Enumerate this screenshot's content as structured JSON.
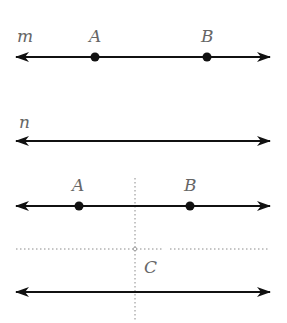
{
  "figure": {
    "width": 287,
    "height": 323,
    "colors": {
      "line": "#111111",
      "label": "#666666",
      "dotted": "#8a8a8a",
      "background": "#ffffff"
    },
    "panel1": {
      "line_label": "m",
      "line_y": 57,
      "points": [
        {
          "label": "A",
          "x": 95
        },
        {
          "label": "B",
          "x": 207
        }
      ]
    },
    "panel2": {
      "line_label": "n",
      "line_y": 141
    },
    "panel3": {
      "top_line_y": 206,
      "bottom_line_y": 292,
      "points": [
        {
          "label": "A",
          "x": 79
        },
        {
          "label": "B",
          "x": 190
        }
      ],
      "vertical_dotted_x": 135,
      "horizontal_dotted_y": 249,
      "intersection_label": "C"
    }
  }
}
